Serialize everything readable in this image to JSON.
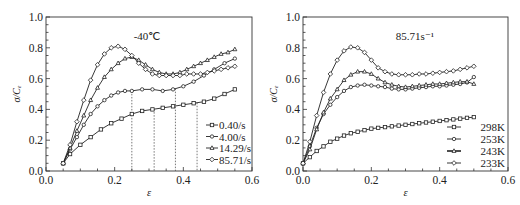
{
  "chart_data": [
    {
      "type": "line",
      "title": "-40℃",
      "xlabel": "ε",
      "ylabel": "σ/Cₑ",
      "xlim": [
        0.0,
        0.6
      ],
      "ylim": [
        0.0,
        1.0
      ],
      "xticks": [
        "0.0",
        "0.2",
        "0.4",
        "0.6"
      ],
      "yticks": [
        "0.0",
        "0.2",
        "0.4",
        "0.6",
        "0.8",
        "1.0"
      ],
      "grid": false,
      "legend_position": "lower right",
      "vertical_dashed_lines_x": [
        0.25,
        0.315,
        0.377,
        0.44
      ],
      "series": [
        {
          "name": "0.40/s",
          "marker": "square",
          "x": [
            0.05,
            0.07,
            0.1,
            0.13,
            0.16,
            0.19,
            0.22,
            0.25,
            0.28,
            0.31,
            0.34,
            0.37,
            0.4,
            0.43,
            0.46,
            0.49,
            0.52,
            0.55
          ],
          "y": [
            0.05,
            0.11,
            0.17,
            0.22,
            0.27,
            0.31,
            0.34,
            0.37,
            0.39,
            0.4,
            0.41,
            0.42,
            0.43,
            0.44,
            0.45,
            0.47,
            0.5,
            0.53
          ]
        },
        {
          "name": "4.00/s",
          "marker": "circle",
          "x": [
            0.05,
            0.07,
            0.09,
            0.11,
            0.13,
            0.15,
            0.17,
            0.19,
            0.21,
            0.23,
            0.25,
            0.28,
            0.31,
            0.34,
            0.37,
            0.4,
            0.43,
            0.46,
            0.49,
            0.52,
            0.55
          ],
          "y": [
            0.05,
            0.14,
            0.22,
            0.3,
            0.37,
            0.42,
            0.46,
            0.49,
            0.51,
            0.52,
            0.52,
            0.53,
            0.53,
            0.52,
            0.53,
            0.55,
            0.58,
            0.62,
            0.66,
            0.7,
            0.73
          ]
        },
        {
          "name": "14.29/s",
          "marker": "triangle",
          "x": [
            0.05,
            0.07,
            0.09,
            0.11,
            0.13,
            0.15,
            0.17,
            0.19,
            0.21,
            0.23,
            0.25,
            0.27,
            0.29,
            0.31,
            0.33,
            0.35,
            0.37,
            0.39,
            0.41,
            0.43,
            0.45,
            0.47,
            0.49,
            0.51,
            0.53,
            0.55
          ],
          "y": [
            0.05,
            0.15,
            0.26,
            0.36,
            0.46,
            0.54,
            0.61,
            0.66,
            0.7,
            0.73,
            0.74,
            0.72,
            0.69,
            0.66,
            0.64,
            0.63,
            0.63,
            0.64,
            0.66,
            0.68,
            0.7,
            0.72,
            0.74,
            0.76,
            0.77,
            0.79
          ]
        },
        {
          "name": "85.71/s",
          "marker": "diamond",
          "x": [
            0.05,
            0.07,
            0.09,
            0.11,
            0.13,
            0.15,
            0.17,
            0.19,
            0.21,
            0.23,
            0.25,
            0.27,
            0.29,
            0.31,
            0.33,
            0.35,
            0.37,
            0.39,
            0.41,
            0.43,
            0.45,
            0.47,
            0.49,
            0.51,
            0.53,
            0.55
          ],
          "y": [
            0.05,
            0.17,
            0.32,
            0.46,
            0.59,
            0.69,
            0.76,
            0.8,
            0.81,
            0.79,
            0.75,
            0.7,
            0.66,
            0.63,
            0.62,
            0.62,
            0.62,
            0.62,
            0.63,
            0.63,
            0.63,
            0.64,
            0.65,
            0.66,
            0.67,
            0.68
          ]
        }
      ]
    },
    {
      "type": "line",
      "title": "85.71s⁻¹",
      "xlabel": "ε",
      "ylabel": "σ/Cₑ",
      "xlim": [
        0.0,
        0.6
      ],
      "ylim": [
        0.0,
        1.0
      ],
      "xticks": [
        "0.0",
        "0.2",
        "0.4",
        "0.6"
      ],
      "yticks": [
        "0.0",
        "0.2",
        "0.4",
        "0.6",
        "0.8",
        "1.0"
      ],
      "grid": false,
      "legend_position": "lower right",
      "series": [
        {
          "name": "298K",
          "marker": "square",
          "x": [
            0.0,
            0.02,
            0.04,
            0.06,
            0.08,
            0.1,
            0.12,
            0.14,
            0.16,
            0.18,
            0.2,
            0.22,
            0.24,
            0.26,
            0.28,
            0.3,
            0.32,
            0.34,
            0.36,
            0.38,
            0.4,
            0.42,
            0.44,
            0.46,
            0.48,
            0.5
          ],
          "y": [
            0.05,
            0.09,
            0.13,
            0.16,
            0.19,
            0.21,
            0.23,
            0.245,
            0.255,
            0.265,
            0.275,
            0.28,
            0.285,
            0.29,
            0.295,
            0.3,
            0.305,
            0.31,
            0.315,
            0.32,
            0.325,
            0.33,
            0.335,
            0.34,
            0.345,
            0.35
          ]
        },
        {
          "name": "253K",
          "marker": "circle",
          "x": [
            0.0,
            0.02,
            0.04,
            0.06,
            0.08,
            0.1,
            0.12,
            0.14,
            0.16,
            0.18,
            0.2,
            0.22,
            0.24,
            0.26,
            0.28,
            0.3,
            0.32,
            0.34,
            0.36,
            0.38,
            0.4,
            0.42,
            0.44,
            0.46,
            0.48,
            0.5
          ],
          "y": [
            0.05,
            0.16,
            0.28,
            0.37,
            0.43,
            0.48,
            0.52,
            0.545,
            0.555,
            0.56,
            0.555,
            0.55,
            0.545,
            0.535,
            0.53,
            0.53,
            0.535,
            0.54,
            0.545,
            0.55,
            0.55,
            0.555,
            0.56,
            0.565,
            0.575,
            0.61
          ]
        },
        {
          "name": "243K",
          "marker": "triangle",
          "x": [
            0.0,
            0.02,
            0.04,
            0.06,
            0.08,
            0.1,
            0.12,
            0.14,
            0.16,
            0.18,
            0.2,
            0.22,
            0.24,
            0.26,
            0.28,
            0.3,
            0.32,
            0.34,
            0.36,
            0.38,
            0.4,
            0.42,
            0.44,
            0.46,
            0.48,
            0.5
          ],
          "y": [
            0.05,
            0.14,
            0.27,
            0.38,
            0.47,
            0.53,
            0.59,
            0.625,
            0.645,
            0.645,
            0.63,
            0.6,
            0.575,
            0.56,
            0.55,
            0.545,
            0.55,
            0.555,
            0.56,
            0.565,
            0.565,
            0.57,
            0.575,
            0.58,
            0.58,
            0.565
          ]
        },
        {
          "name": "233K",
          "marker": "diamond",
          "x": [
            0.0,
            0.02,
            0.04,
            0.06,
            0.08,
            0.1,
            0.12,
            0.14,
            0.16,
            0.18,
            0.2,
            0.22,
            0.24,
            0.26,
            0.28,
            0.3,
            0.32,
            0.34,
            0.36,
            0.38,
            0.4,
            0.42,
            0.44,
            0.46,
            0.48,
            0.5
          ],
          "y": [
            0.05,
            0.19,
            0.36,
            0.51,
            0.63,
            0.72,
            0.78,
            0.805,
            0.8,
            0.77,
            0.72,
            0.67,
            0.645,
            0.63,
            0.625,
            0.625,
            0.625,
            0.63,
            0.63,
            0.635,
            0.64,
            0.645,
            0.65,
            0.66,
            0.67,
            0.68
          ]
        }
      ]
    }
  ],
  "panels": {
    "left": {
      "title": "-40℃",
      "xlabel": "ε",
      "ylabel": "σ/Cₑ"
    },
    "right": {
      "title": "85.71s⁻¹",
      "xlabel": "ε",
      "ylabel": "σ/Cₑ"
    }
  },
  "colors": {
    "line": "#222222",
    "axis": "#333333",
    "dashed": "#555555",
    "background": "#ffffff"
  }
}
